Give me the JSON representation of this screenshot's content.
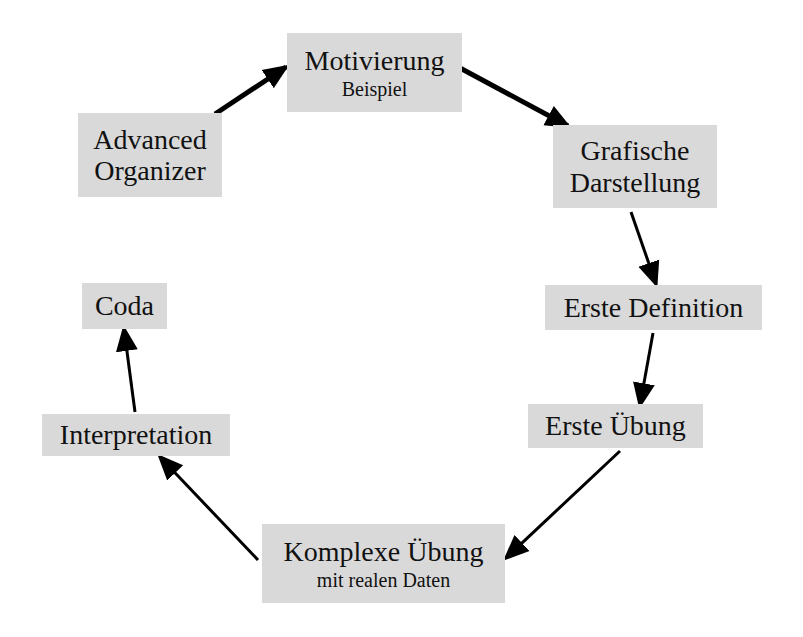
{
  "diagram": {
    "type": "cycle-flow",
    "node_fill": "#d9d9d9",
    "arrow_color": "#000000",
    "nodes": [
      {
        "id": "motivierung",
        "label": "Motivierung",
        "sublabel": "Beispiel",
        "box": [
          287,
          33,
          175,
          79
        ]
      },
      {
        "id": "grafische",
        "label": "Grafische",
        "label2": "Darstellung",
        "box": [
          553,
          125,
          164,
          83
        ]
      },
      {
        "id": "definition",
        "label": "Erste Definition",
        "box": [
          545,
          285,
          217,
          45
        ]
      },
      {
        "id": "erste_uebung",
        "label": "Erste Übung",
        "box": [
          528,
          404,
          175,
          44
        ]
      },
      {
        "id": "komplexe",
        "label": "Komplexe Übung",
        "sublabel": "mit realen Daten",
        "box": [
          262,
          524,
          243,
          79
        ]
      },
      {
        "id": "interpretation",
        "label": "Interpretation",
        "box": [
          42,
          414,
          188,
          42
        ]
      },
      {
        "id": "coda",
        "label": "Coda",
        "box": [
          82,
          283,
          85,
          46
        ]
      },
      {
        "id": "organizer",
        "label": "Advanced",
        "label2": "Organizer",
        "box": [
          78,
          113,
          144,
          84
        ]
      }
    ],
    "edges": [
      {
        "from": "organizer",
        "to": "motivierung"
      },
      {
        "from": "motivierung",
        "to": "grafische"
      },
      {
        "from": "grafische",
        "to": "definition"
      },
      {
        "from": "definition",
        "to": "erste_uebung"
      },
      {
        "from": "erste_uebung",
        "to": "komplexe"
      },
      {
        "from": "komplexe",
        "to": "interpretation"
      },
      {
        "from": "interpretation",
        "to": "coda"
      }
    ]
  }
}
